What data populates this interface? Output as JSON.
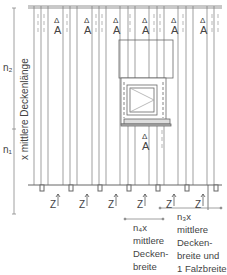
{
  "diagram": {
    "left_labels": {
      "n2": "n₂",
      "n1": "n₁",
      "vertical": "x  mittlere Deckenlänge"
    },
    "marker_A": "A",
    "marker_delta": "Δ",
    "bottom_markers": [
      "Z",
      "Z",
      "Z",
      "Z",
      "Z",
      "Z"
    ],
    "note_n4": "n₄x\nmittlere\nDecken-\nbreite",
    "note_n3": "n₃x\nmittlere\nDecken-\nbreite und\n1 Falzbreite"
  },
  "colors": {
    "line": "#6a6a6a",
    "light": "#aaaaaa",
    "text": "#444444"
  }
}
